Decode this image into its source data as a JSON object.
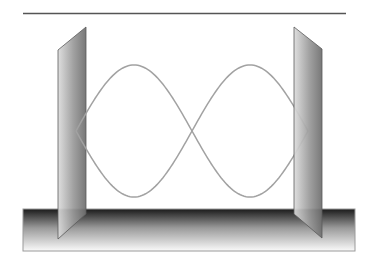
{
  "diagram": {
    "description": "Standing wave between two reflecting plates on a base",
    "canvas": {
      "width": 376,
      "height": 265,
      "background": "#ffffff"
    },
    "top_rule": {
      "x1": 23,
      "y1": 13.5,
      "x2": 346,
      "y2": 13.5,
      "color": "#555555",
      "width": 1.6
    },
    "base": {
      "x": 23,
      "y": 209,
      "width": 332,
      "height": 42,
      "gradient_top": "#1a1a1a",
      "gradient_mid": "#9a9a9a",
      "gradient_bottom": "#fafafa",
      "border": "#9a9a9a"
    },
    "plates": [
      {
        "name": "left-plate",
        "points": [
          [
            58,
            50
          ],
          [
            86,
            27
          ],
          [
            86,
            214
          ],
          [
            58,
            239
          ]
        ],
        "gradient_light": "#dcdcdc",
        "gradient_dark": "#6e6e6e",
        "edge": "#5a5a5a"
      },
      {
        "name": "right-plate",
        "points": [
          [
            294,
            27
          ],
          [
            322,
            49
          ],
          [
            322,
            238
          ],
          [
            294,
            214
          ]
        ],
        "gradient_light": "#dcdcdc",
        "gradient_dark": "#6e6e6e",
        "edge": "#5a5a5a"
      }
    ],
    "waves": {
      "x_start": 76,
      "x_end": 308,
      "y_center": 131,
      "amplitude": 66,
      "half_wavelengths": 2,
      "color": "#a2a2a2",
      "stroke_width": 1.5,
      "curves": [
        {
          "name": "wave-positive",
          "sign": 1
        },
        {
          "name": "wave-negative",
          "sign": -1
        }
      ]
    }
  }
}
